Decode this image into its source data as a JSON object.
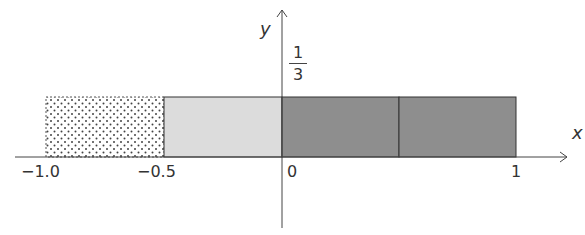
{
  "diagram": {
    "type": "uniform-distribution-rectangles",
    "axes": {
      "x_label": "x",
      "y_label": "y",
      "x_ticks": [
        {
          "value": -1.0,
          "label": "−1.0"
        },
        {
          "value": -0.5,
          "label": "−0.5"
        },
        {
          "value": 0,
          "label": "0"
        },
        {
          "value": 1,
          "label": "1"
        }
      ],
      "y_ticks": [
        {
          "value": 0.3333,
          "numerator": "1",
          "denominator": "3"
        }
      ]
    },
    "regions": [
      {
        "x_start": -1.0,
        "x_end": -0.5,
        "height": "1/3",
        "fill": "dotted",
        "color": "#ffffff"
      },
      {
        "x_start": -0.5,
        "x_end": 0,
        "height": "1/3",
        "fill": "light-gray",
        "color": "#d9d9d9"
      },
      {
        "x_start": 0,
        "x_end": 0.5,
        "height": "1/3",
        "fill": "dark-gray",
        "color": "#8c8c8c"
      },
      {
        "x_start": 0.5,
        "x_end": 1.0,
        "height": "1/3",
        "fill": "dark-gray",
        "color": "#8c8c8c"
      }
    ]
  }
}
